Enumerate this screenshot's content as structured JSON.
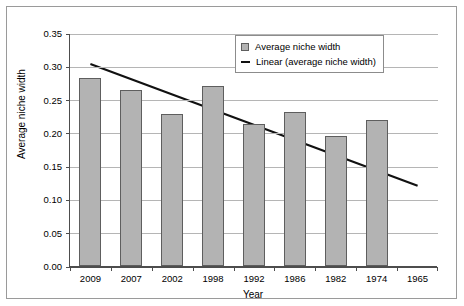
{
  "chart_data": {
    "type": "bar",
    "title": "",
    "xlabel": "Year",
    "ylabel": "Average niche width",
    "categories": [
      "2009",
      "2007",
      "2002",
      "1998",
      "1992",
      "1986",
      "1982",
      "1974",
      "1965"
    ],
    "values": [
      0.282,
      0.264,
      0.229,
      0.271,
      0.213,
      0.232,
      0.195,
      0.219,
      null
    ],
    "ylim": [
      0.0,
      0.35
    ],
    "ytick_labels": [
      "0.00",
      "0.05",
      "0.10",
      "0.15",
      "0.20",
      "0.25",
      "0.30",
      "0.35"
    ],
    "ytick_values": [
      0.0,
      0.05,
      0.1,
      0.15,
      0.2,
      0.25,
      0.3,
      0.35
    ],
    "grid": true,
    "legend_position": "top-right",
    "series": [
      {
        "name": "Average niche width",
        "type": "bar",
        "color": "#b3b3b3",
        "values": [
          0.282,
          0.264,
          0.229,
          0.271,
          0.213,
          0.232,
          0.195,
          0.219,
          null
        ]
      },
      {
        "name": "Linear (average niche width)",
        "type": "line",
        "color": "#111111",
        "trend_start_value": 0.305,
        "trend_end_value": 0.122
      }
    ],
    "legend": [
      {
        "label": "Average niche width",
        "marker": "box",
        "color": "#b3b3b3"
      },
      {
        "label": "Linear (average niche width)",
        "marker": "line",
        "color": "#111111"
      }
    ]
  },
  "axes": {
    "y_title": "Average niche width",
    "x_title": "Year"
  },
  "colors": {
    "bar_fill": "#b3b3b3",
    "bar_stroke": "#5e5e5e",
    "trend_line": "#111111",
    "gridline": "#b5b5b5",
    "axis": "#4d4d4d",
    "frame": "#9a9a9a"
  }
}
